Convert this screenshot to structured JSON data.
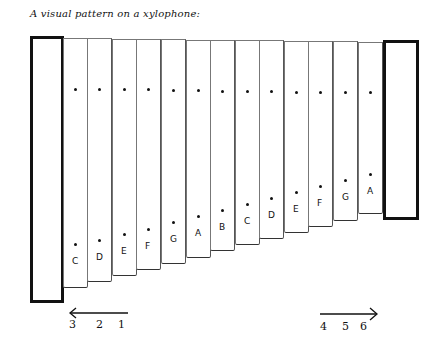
{
  "title": "A visual pattern on a xylophone:",
  "bars": [
    {
      "note": "C",
      "left": 63,
      "bottom": 288,
      "top_dot": 88,
      "low_dot": 243
    },
    {
      "note": "D",
      "left": 87,
      "bottom": 282,
      "top_dot": 88,
      "low_dot": 239
    },
    {
      "note": "E",
      "left": 112,
      "bottom": 276,
      "top_dot": 88,
      "low_dot": 233
    },
    {
      "note": "F",
      "left": 136,
      "bottom": 270,
      "top_dot": 88,
      "low_dot": 228
    },
    {
      "note": "G",
      "left": 161,
      "bottom": 264,
      "top_dot": 89,
      "low_dot": 221
    },
    {
      "note": "A",
      "left": 186,
      "bottom": 258,
      "top_dot": 89,
      "low_dot": 215
    },
    {
      "note": "B",
      "left": 210,
      "bottom": 251,
      "top_dot": 90,
      "low_dot": 209
    },
    {
      "note": "C",
      "left": 235,
      "bottom": 245,
      "top_dot": 90,
      "low_dot": 203
    },
    {
      "note": "D",
      "left": 259,
      "bottom": 239,
      "top_dot": 90,
      "low_dot": 197
    },
    {
      "note": "E",
      "left": 284,
      "bottom": 233,
      "top_dot": 91,
      "low_dot": 191
    },
    {
      "note": "F",
      "left": 308,
      "bottom": 227,
      "top_dot": 91,
      "low_dot": 185
    },
    {
      "note": "G",
      "left": 333,
      "bottom": 221,
      "top_dot": 91,
      "low_dot": 179
    },
    {
      "note": "A",
      "left": 358,
      "bottom": 214,
      "top_dot": 91,
      "low_dot": 173
    }
  ],
  "left_arrow": {
    "direction": "left",
    "labels": [
      "3",
      "2",
      "1"
    ]
  },
  "right_arrow": {
    "direction": "right",
    "labels": [
      "4",
      "5",
      "6"
    ]
  },
  "colors": {
    "ink": "#111111",
    "bar_border": "#777777",
    "background": "#ffffff"
  }
}
